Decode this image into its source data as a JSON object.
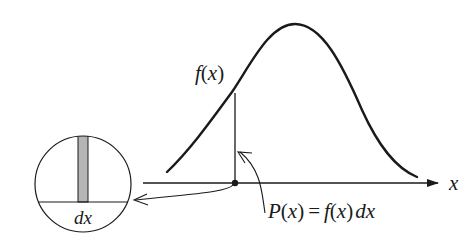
{
  "diagram": {
    "type": "probability-density-illustration",
    "curve_label": {
      "f": "f",
      "lp": "(",
      "x": "x",
      "rp": ")"
    },
    "axis_label": "x",
    "equation": {
      "P": "P",
      "lp1": "(",
      "x1": "x",
      "rp1": ")",
      "eq": "=",
      "f": "f",
      "lp2": "(",
      "x2": "x",
      "rp2": ")",
      "dx": "dx"
    },
    "magnifier_label": "dx",
    "colors": {
      "stroke": "#1a1a1a",
      "strip_fill": "#b5b5b5",
      "background": "#ffffff"
    }
  }
}
